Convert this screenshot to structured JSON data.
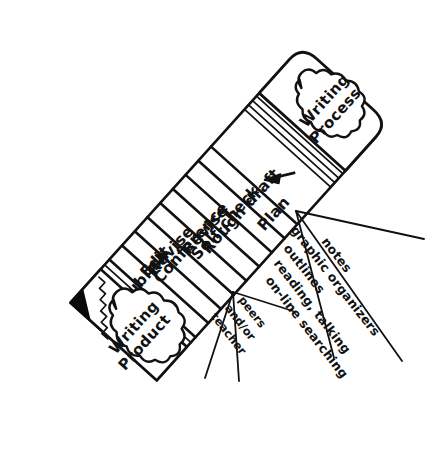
{
  "diagram": {
    "kind": "hand-drawn-diagram",
    "ink_color": "#111111",
    "paper_color": "#ffffff",
    "graphite_color": "#0a0a0a"
  },
  "eraser": {
    "name": "eraser",
    "cloud_line_1": "Writing",
    "cloud_line_2": "Process",
    "texture": "stippled"
  },
  "tip": {
    "name": "sharpened-pencil-tip",
    "cloud_line_1": "Writing",
    "cloud_line_2": "Product",
    "graphite": "black point"
  },
  "arrow": {
    "name": "direction-arrow",
    "direction": "down-left along pencil"
  },
  "steps": [
    {
      "index": 1,
      "label": "Plan"
    },
    {
      "index": 2,
      "label": "Rough draft"
    },
    {
      "index": 3,
      "label": "Self-check"
    },
    {
      "index": 4,
      "label": "Revise"
    },
    {
      "index": 5,
      "label": "Conference"
    },
    {
      "index": 6,
      "label": "Revise"
    },
    {
      "index": 7,
      "label": "Edit"
    },
    {
      "index": 8,
      "label": "Publish"
    }
  ],
  "annotations": {
    "right_fan": {
      "name": "resources-annotation",
      "points_to": "Plan / Rough draft",
      "lines": [
        "notes",
        "graphic organizers",
        "outlines",
        "reading, talking",
        "on-line searching"
      ]
    },
    "lower_fan": {
      "name": "conference-annotation",
      "points_to": "Conference",
      "lines": [
        "peers",
        "and/or",
        "teacher"
      ]
    }
  }
}
